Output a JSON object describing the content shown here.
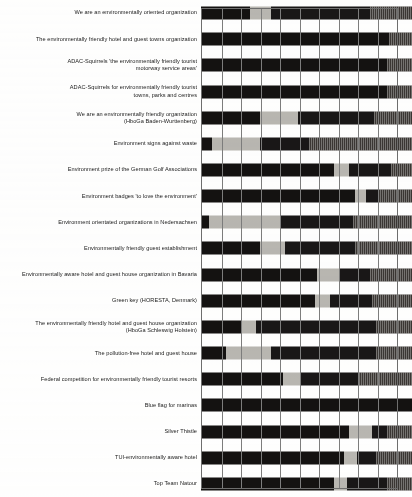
{
  "chart_data": {
    "type": "bar",
    "subtype": "horizontal-stacked-100-percent",
    "title": "",
    "subtitle": "",
    "xlabel": "",
    "ylabel": "",
    "xlim": [
      0,
      100
    ],
    "grid": true,
    "grid_axis": "x",
    "gridline_values": [
      0,
      10,
      20,
      30,
      40,
      50,
      60,
      70,
      80,
      90,
      100
    ],
    "legend_position": "none",
    "legend_entries": [],
    "orientation": "horizontal",
    "categories": [
      "We are an environmentally oriented organization",
      "The environmentally friendly hotel and guest towns organization",
      "ADAC-Squirrels 'the environmentally friendly tourist\nmotorway service areas'",
      "ADAC-Squirrels for environmentally friendly tourist\ntowns, parks and centres",
      "We are an environmentally friendly organization\n(HboGa Baden-Wurttenberg)",
      "Environment signs against waste",
      "Environment prize of the German Golf Associations",
      "Environment badges 'to love the environment'",
      "Environment orientated organizations in Nedersachsen",
      "Environmentally friendly guest establishment",
      "Environmentally aware hotel and guest house organization in Bavaria",
      "Green key (HORESTA, Denmark)",
      "The environmentally friendly hotel and guest house organization\n(HboGa Schleswig Holstein)",
      "The pollution-free hotel and guest house",
      "Federal competition for environmentally friendly tourist resorts",
      "Blue flag for marinas",
      "Silver Thistle",
      "TUI-environmentally aware hotel",
      "Top Team Natour"
    ],
    "series": [
      {
        "name": "segment-1",
        "color": "#141211",
        "values": [
          23,
          89,
          88,
          88,
          28,
          5,
          63,
          73,
          4,
          28,
          55,
          54,
          19,
          12,
          39,
          100,
          70,
          68,
          63
        ]
      },
      {
        "name": "segment-2",
        "color": "#b9b7b2",
        "values": [
          10,
          0,
          0,
          0,
          18,
          23,
          7,
          5,
          34,
          12,
          11,
          7,
          7,
          21,
          8,
          0,
          11,
          6,
          6
        ]
      },
      {
        "name": "segment-3",
        "color": "#191717",
        "values": [
          47,
          0,
          0,
          0,
          36,
          23,
          20,
          6,
          34,
          33,
          14,
          20,
          57,
          50,
          28,
          0,
          7,
          9,
          19
        ]
      },
      {
        "name": "segment-4",
        "color": "#3a3633",
        "values": [
          20,
          11,
          12,
          12,
          18,
          49,
          10,
          16,
          28,
          27,
          20,
          19,
          17,
          17,
          25,
          0,
          12,
          17,
          12
        ]
      }
    ]
  }
}
